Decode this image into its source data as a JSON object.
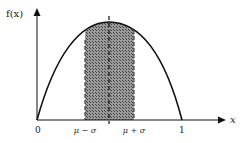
{
  "diagram": {
    "type": "probability-density-plot",
    "y_axis_label": "f(x)",
    "x_axis_label": "x",
    "tick_labels": {
      "origin": "0",
      "mu_minus_sigma": "μ − σ",
      "mu_plus_sigma": "μ + σ",
      "one": "1"
    },
    "shaded_region": "μ − σ to μ + σ",
    "colors": {
      "curve": "#111111",
      "axes": "#111111",
      "shading": "#555555",
      "background": "#ffffff"
    }
  }
}
